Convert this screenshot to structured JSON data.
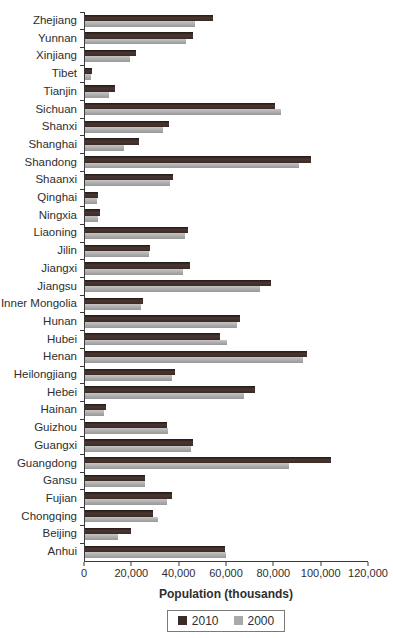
{
  "chart_data": {
    "type": "bar",
    "orientation": "horizontal",
    "title": "",
    "xlabel": "Population (thousands)",
    "ylabel": "",
    "xlim": [
      0,
      120000
    ],
    "xticks": [
      0,
      20000,
      40000,
      60000,
      80000,
      100000,
      120000
    ],
    "xtick_labels": [
      "0",
      "20,000",
      "40,000",
      "60,000",
      "80,000",
      "100,000",
      "120,000"
    ],
    "grid": false,
    "legend_position": "bottom",
    "categories": [
      "Zhejiang",
      "Yunnan",
      "Xinjiang",
      "Tibet",
      "Tianjin",
      "Sichuan",
      "Shanxi",
      "Shanghai",
      "Shandong",
      "Shaanxi",
      "Qinghai",
      "Ningxia",
      "Liaoning",
      "Jilin",
      "Jiangxi",
      "Jiangsu",
      "Inner Mongolia",
      "Hunan",
      "Hubei",
      "Henan",
      "Heilongjiang",
      "Hebei",
      "Hainan",
      "Guizhou",
      "Guangxi",
      "Guangdong",
      "Gansu",
      "Fujian",
      "Chongqing",
      "Beijing",
      "Anhui"
    ],
    "series": [
      {
        "name": "2010",
        "color": "#3b2c28",
        "values": [
          54400,
          46000,
          21800,
          3000,
          12900,
          80400,
          35700,
          23000,
          95800,
          37300,
          5600,
          6300,
          43700,
          27500,
          44600,
          78700,
          24700,
          65700,
          57200,
          94000,
          38300,
          71900,
          8700,
          34700,
          46000,
          104300,
          25600,
          36900,
          28800,
          19600,
          59500
        ]
      },
      {
        "name": "2000",
        "color": "#a9a9a9",
        "values": [
          46800,
          42900,
          19200,
          2600,
          10000,
          83300,
          33000,
          16700,
          90800,
          36100,
          5200,
          5600,
          42400,
          27300,
          41400,
          74400,
          23800,
          64400,
          60300,
          92600,
          36900,
          67400,
          7900,
          35200,
          44900,
          86400,
          25600,
          34700,
          30900,
          13800,
          59900
        ]
      }
    ]
  }
}
